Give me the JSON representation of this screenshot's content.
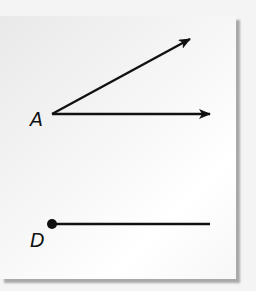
{
  "figure": {
    "labels": {
      "point_a": "A",
      "point_d": "D"
    },
    "elements": [
      {
        "type": "ray",
        "from": "A",
        "direction": "upper-right",
        "start": [
          52,
          114
        ],
        "end": [
          190,
          39
        ]
      },
      {
        "type": "ray",
        "from": "A",
        "direction": "right",
        "start": [
          52,
          114
        ],
        "end": [
          210,
          114
        ]
      },
      {
        "type": "ray",
        "from": "D",
        "direction": "right",
        "start": [
          52,
          224
        ],
        "end": [
          210,
          224
        ],
        "endpoint_dot": true
      }
    ],
    "colors": {
      "stroke": "#111111",
      "card": "#f8f8f8",
      "shadow": "#a9a9a9"
    }
  }
}
